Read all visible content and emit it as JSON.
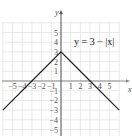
{
  "chart_data": {
    "type": "line",
    "title": "",
    "xlabel": "x",
    "ylabel": "y",
    "annotation": "y = 3 − |x|",
    "xlim": [
      -6,
      6
    ],
    "ylim": [
      -6,
      6
    ],
    "grid": true,
    "x_ticks": [
      -5,
      -4,
      -3,
      -2,
      -1,
      1,
      2,
      3,
      4,
      5
    ],
    "y_ticks": [
      5,
      4,
      3,
      2,
      1,
      -1,
      -2,
      -3,
      -4,
      -5
    ],
    "series": [
      {
        "name": "y = 3 − |x|",
        "x": [
          -6,
          -3,
          0,
          3,
          6
        ],
        "y": [
          -3,
          0,
          3,
          0,
          -3
        ]
      }
    ]
  },
  "labels": {
    "x_axis": "x",
    "y_axis": "y",
    "equation": "y = 3 − |x|",
    "x_tick_labels": [
      "−5",
      "−4",
      "−3",
      "−2",
      "−1",
      "1",
      "2",
      "3",
      "4",
      "5"
    ],
    "y_tick_labels": [
      "5",
      "4",
      "3",
      "2",
      "1",
      "−1",
      "−2",
      "−3",
      "−4",
      "−5"
    ]
  }
}
